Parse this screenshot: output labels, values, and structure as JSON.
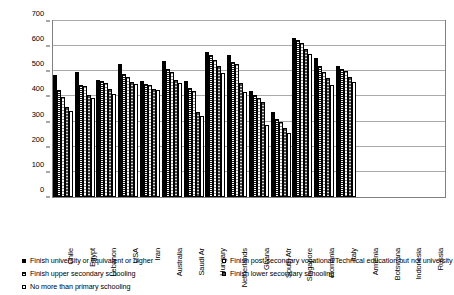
{
  "chart_data": {
    "type": "bar",
    "title": "",
    "subtitle": "",
    "xlabel": "",
    "ylabel": "",
    "ylim": [
      0,
      700
    ],
    "ytick_step": 100,
    "yticks": [
      "0",
      "100",
      "200",
      "300",
      "400",
      "500",
      "600",
      "700"
    ],
    "grid": true,
    "legend_position": "bottom",
    "categories": [
      "Chile",
      "Egypt",
      "Lebanon",
      "USA",
      "Iran",
      "Australia",
      "Saudi Ar",
      "Hungary",
      "Netherlands",
      "Ghana",
      "South Afr",
      "Singapore",
      "Romania",
      "Italy",
      "Armenia",
      "Botswana",
      "Indonesia",
      "Russia"
    ],
    "series": [
      {
        "name": "Finish university or equivalent or higher",
        "marker": "solid-black",
        "color": "#000000",
        "values": [
          487,
          499,
          467,
          530,
          461,
          539,
          461,
          578,
          566,
          421,
          339,
          632,
          551,
          521,
          null,
          null,
          null,
          null
        ]
      },
      {
        "name": "Finish post-secondary vocational/Technical education but not university",
        "marker": "open-white",
        "color": "#ffffff",
        "values": [
          424,
          446,
          461,
          491,
          450,
          511,
          432,
          563,
          537,
          404,
          311,
          625,
          520,
          508,
          null,
          null,
          null,
          null
        ]
      },
      {
        "name": "Finish upper secondary schooling",
        "marker": "dense-hatch",
        "color": "#1a1a1a",
        "values": [
          399,
          443,
          453,
          478,
          444,
          498,
          422,
          546,
          531,
          395,
          299,
          612,
          497,
          502,
          null,
          null,
          null,
          null
        ]
      },
      {
        "name": "Finish lower secondary schooling",
        "marker": "mid-grey",
        "color": "#4d4d4d",
        "values": [
          357,
          405,
          428,
          459,
          431,
          466,
          339,
          521,
          452,
          379,
          276,
          589,
          473,
          477,
          null,
          null,
          null,
          null
        ]
      },
      {
        "name": "No more than primary schooling",
        "marker": "open-white-2",
        "color": "#ffffff",
        "values": [
          341,
          392,
          409,
          451,
          425,
          452,
          324,
          492,
          417,
          286,
          253,
          570,
          447,
          456,
          null,
          null,
          null,
          null
        ]
      }
    ]
  },
  "legend": {
    "left_items": [
      "Finish university or equivalent or higher",
      "Finish upper secondary schooling",
      "No more than primary schooling"
    ],
    "right_items": [
      "Finish post-secondary vocational/Technical education but not university",
      "Finish lower secondary schooling"
    ]
  }
}
